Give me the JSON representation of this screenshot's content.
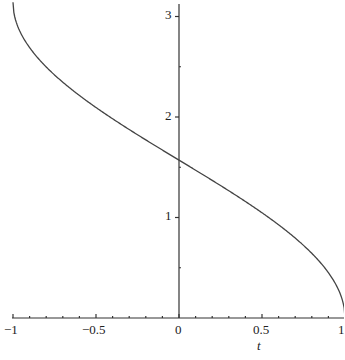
{
  "chart_data": {
    "type": "line",
    "title": "",
    "xlabel": "t",
    "ylabel": "",
    "xlim": [
      -1,
      1
    ],
    "ylim": [
      0,
      3.1416
    ],
    "x_ticks": [
      "-1",
      "-0.5",
      "0",
      "0.5",
      "1"
    ],
    "y_ticks": [
      "1",
      "2",
      "3"
    ],
    "grid": false,
    "series": [
      {
        "name": "arccos(t)",
        "x": [
          -1,
          -0.75,
          -0.5,
          -0.25,
          0,
          0.25,
          0.5,
          0.75,
          1
        ],
        "values": [
          3.1416,
          2.4189,
          2.0944,
          1.8235,
          1.5708,
          1.3181,
          1.0472,
          0.7227,
          0
        ]
      }
    ]
  },
  "labels": {
    "x_axis": "t",
    "xm1": "−1",
    "xm05": "−0.5",
    "x0": "0",
    "x05": "0.5",
    "x1": "1",
    "y1": "1",
    "y2": "2",
    "y3": "3"
  }
}
